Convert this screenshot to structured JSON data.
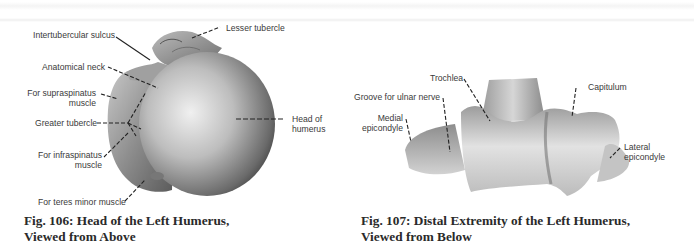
{
  "figures": [
    {
      "id": "fig106",
      "caption_line1": "Fig. 106: Head of the Left Humerus,",
      "caption_line2": "Viewed from Above",
      "labels": {
        "lesser_tubercle": "Lesser tubercle",
        "intertubercular_sulcus": "Intertubercular sulcus",
        "anatomical_neck": "Anatomical neck",
        "supraspinatus_1": "For supraspinatus",
        "supraspinatus_2": "muscle",
        "greater_tubercle": "Greater tubercle",
        "head_1": "Head of",
        "head_2": "humerus",
        "infraspinatus_1": "For infraspinatus",
        "infraspinatus_2": "muscle",
        "teres_minor": "For teres minor muscle"
      }
    },
    {
      "id": "fig107",
      "caption_line1": "Fig. 107: Distal Extremity of the Left Humerus,",
      "caption_line2": "Viewed from Below",
      "labels": {
        "trochlea": "Trochlea",
        "capitulum": "Capitulum",
        "groove_ulnar": "Groove for ulnar nerve",
        "medial_1": "Medial",
        "medial_2": "epicondyle",
        "lateral_1": "Lateral",
        "lateral_2": "epicondyle"
      }
    }
  ],
  "colors": {
    "label_text": "#3a3a3a",
    "caption_text": "#2a2a2a",
    "leader_line": "#222222",
    "bone_light": "#e6e6e6",
    "bone_mid": "#a8a8a8",
    "bone_dark": "#555555"
  }
}
